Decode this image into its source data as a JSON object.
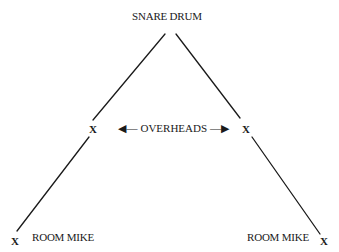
{
  "diagram": {
    "type": "microphone-placement",
    "colors": {
      "line": "#1a1a1a",
      "background": "#ffffff"
    },
    "nodes": {
      "snare": {
        "label": "SNARE DRUM"
      },
      "overheads": {
        "label": "OVERHEADS",
        "arrow_left": "◀—",
        "arrow_right": "—▶"
      },
      "overhead_left": {
        "mark": "X"
      },
      "overhead_right": {
        "mark": "X"
      },
      "room_left": {
        "mark": "X",
        "label": "ROOM MIKE"
      },
      "room_right": {
        "mark": "X",
        "label": "ROOM MIKE"
      }
    },
    "edges": [
      {
        "from": "snare",
        "to": "overhead_left"
      },
      {
        "from": "overhead_left",
        "to": "room_left"
      },
      {
        "from": "snare",
        "to": "overhead_right"
      },
      {
        "from": "overhead_right",
        "to": "room_right"
      }
    ]
  }
}
